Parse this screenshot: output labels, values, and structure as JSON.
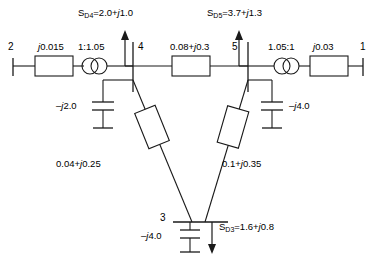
{
  "diagram": {
    "type": "power-system-single-line-diagram",
    "title": "",
    "bus_count": 5,
    "buses": [
      {
        "id": "bus-1",
        "label": "1",
        "x": 363,
        "y": 66,
        "orientation": "vertical-terminal"
      },
      {
        "id": "bus-2",
        "label": "2",
        "x": 13,
        "y": 66,
        "orientation": "vertical-terminal"
      },
      {
        "id": "bus-3",
        "label": "3",
        "x": 198,
        "y": 222,
        "orientation": "horizontal-bar"
      },
      {
        "id": "bus-4",
        "label": "4",
        "x": 133,
        "y": 66,
        "orientation": "vertical-bar"
      },
      {
        "id": "bus-5",
        "label": "5",
        "x": 248,
        "y": 66,
        "orientation": "vertical-bar"
      }
    ],
    "branches": [
      {
        "id": "branch-2-x",
        "label": "j0.015",
        "impedance": "j0.015",
        "italic_prefix": "j",
        "value": "0.015",
        "from": "2",
        "to": "xfmr-A",
        "element": "series-impedance-box"
      },
      {
        "id": "branch-4-5",
        "label": "0.08+j0.3",
        "impedance": "0.08+j0.3",
        "from": "4",
        "to": "5",
        "element": "series-impedance-box"
      },
      {
        "id": "branch-1-x",
        "label": "j0.03",
        "impedance": "j0.03",
        "italic_prefix": "j",
        "value": "0.03",
        "from": "1",
        "to": "xfmr-B",
        "element": "series-impedance-box"
      },
      {
        "id": "branch-4-3",
        "label": "0.04+j0.25",
        "impedance": "0.04+j0.25",
        "from": "4",
        "to": "3",
        "element": "tilted-impedance-box"
      },
      {
        "id": "branch-5-3",
        "label": "0.1+j0.35",
        "impedance": "0.1+j0.35",
        "from": "5",
        "to": "3",
        "element": "tilted-impedance-box"
      }
    ],
    "transformers": [
      {
        "id": "xfmr-A",
        "label": "1:1.05",
        "ratio": "1:1.05",
        "x": 94,
        "y": 66
      },
      {
        "id": "xfmr-B",
        "label": "1.05:1",
        "ratio": "1.05:1",
        "x": 287,
        "y": 66
      }
    ],
    "shunts": [
      {
        "id": "shunt-bus-4",
        "label": "-j2.0",
        "admittance": "-j2.0",
        "bus": "4"
      },
      {
        "id": "shunt-bus-5",
        "label": "-j4.0",
        "admittance": "-j4.0",
        "bus": "5"
      },
      {
        "id": "shunt-bus-3",
        "label": "-j4.0",
        "admittance": "-j4.0",
        "bus": "3"
      }
    ],
    "loads": [
      {
        "id": "load-bus-4",
        "symbol": "S",
        "subscript": "D4",
        "expression": "2.0+j1.0",
        "full": "S_D4=2.0+j1.0",
        "p": 2.0,
        "q": 1.0,
        "bus": "4"
      },
      {
        "id": "load-bus-5",
        "symbol": "S",
        "subscript": "D5",
        "expression": "3.7+j1.3",
        "full": "S_D5=3.7+j1.3",
        "p": 3.7,
        "q": 1.3,
        "bus": "5"
      },
      {
        "id": "load-bus-3",
        "symbol": "S",
        "subscript": "D3",
        "expression": "1.6+j0.8",
        "full": "S_D3=1.6+j0.8",
        "p": 1.6,
        "q": 0.8,
        "bus": "3"
      }
    ],
    "colors": {
      "line": "#1a1a1a",
      "background": "#ffffff",
      "text": "#000000"
    }
  },
  "labels": {
    "bus1": "1",
    "bus2": "2",
    "bus3": "3",
    "bus4": "4",
    "bus5": "5",
    "z_2": "0.015",
    "z_2_j": "j",
    "z_1": "0.03",
    "z_1_j": "j",
    "z_45_re": "0.08+",
    "z_45_j": "j",
    "z_45_im": "0.3",
    "z_43_re": "0.04+",
    "z_43_j": "j",
    "z_43_im": "0.25",
    "z_53_re": "0.1+",
    "z_53_j": "j",
    "z_53_im": "0.35",
    "t_a": "1:1.05",
    "t_b": "1.05:1",
    "y4_sign": "–",
    "y4_j": "j",
    "y4_val": "2.0",
    "y5_sign": "–",
    "y5_j": "j",
    "y5_val": "4.0",
    "y3_sign": "–",
    "y3_j": "j",
    "y3_val": "4.0",
    "sd4_s": "S",
    "sd4_sub": "D4",
    "sd4_eq": "=2.0+",
    "sd4_j": "j",
    "sd4_im": "1.0",
    "sd5_s": "S",
    "sd5_sub": "D5",
    "sd5_eq": "=3.7+",
    "sd5_j": "j",
    "sd5_im": "1.3",
    "sd3_s": "S",
    "sd3_sub": "D3",
    "sd3_eq": "=1.6+",
    "sd3_j": "j",
    "sd3_im": "0.8"
  }
}
